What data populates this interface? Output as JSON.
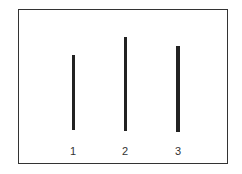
{
  "diagram": {
    "lines": [
      {
        "label": "1",
        "relative_length": 75
      },
      {
        "label": "2",
        "relative_length": 94
      },
      {
        "label": "3",
        "relative_length": 86
      }
    ]
  }
}
